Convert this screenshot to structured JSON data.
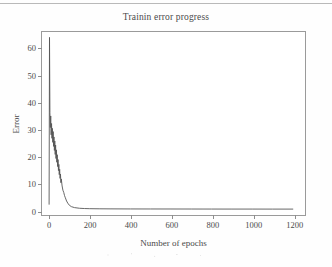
{
  "figure": {
    "page_rule": "",
    "scan_noise": ""
  },
  "chart_data": {
    "type": "line",
    "title": "Trainin error progress",
    "xlabel": "Number of epochs",
    "ylabel": "Error",
    "xlim": [
      -35,
      1260
    ],
    "ylim": [
      -2,
      66
    ],
    "grid": false,
    "legend": null,
    "xticks": [
      0,
      200,
      400,
      600,
      800,
      1000,
      1200
    ],
    "yticks": [
      0,
      10,
      20,
      30,
      40,
      50,
      60
    ],
    "xticklabels": [
      "0",
      "200",
      "400",
      "600",
      "800",
      "1000",
      "1200"
    ],
    "yticklabels": [
      "0",
      "10",
      "20",
      "30",
      "40",
      "50",
      "60"
    ],
    "line_color": "#555555",
    "line_width": 0.9,
    "series": [
      {
        "name": "training error",
        "x": [
          0,
          2,
          4,
          6,
          8,
          10,
          12,
          14,
          16,
          18,
          20,
          22,
          24,
          26,
          28,
          30,
          32,
          34,
          36,
          38,
          40,
          42,
          44,
          46,
          48,
          50,
          52,
          54,
          56,
          58,
          60,
          64,
          68,
          72,
          76,
          80,
          86,
          92,
          100,
          110,
          125,
          150,
          175,
          200,
          250,
          300,
          400,
          500,
          600,
          700,
          800,
          900,
          1000,
          1100,
          1200
        ],
        "y": [
          2.0,
          64.0,
          36.0,
          30.5,
          34.8,
          27.8,
          32.0,
          26.5,
          30.2,
          25.0,
          29.0,
          23.5,
          27.0,
          22.0,
          25.5,
          20.5,
          24.0,
          19.0,
          22.2,
          17.6,
          20.4,
          16.0,
          18.6,
          14.5,
          16.8,
          13.0,
          15.0,
          11.6,
          13.2,
          10.0,
          11.4,
          8.8,
          7.2,
          6.4,
          5.2,
          4.4,
          3.2,
          2.4,
          1.6,
          1.1,
          0.75,
          0.5,
          0.4,
          0.35,
          0.3,
          0.28,
          0.25,
          0.24,
          0.23,
          0.22,
          0.21,
          0.2,
          0.2,
          0.19,
          0.19
        ]
      }
    ]
  }
}
